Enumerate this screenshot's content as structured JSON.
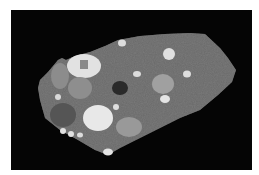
{
  "image": {
    "description": "Polished cross-section of a grey granular stone slab with rounded inclusions on a black background",
    "colors": {
      "background": "#ffffff",
      "frame": "#050505",
      "matrix": "#7a7a7a",
      "inclusion_light": "#e6e6e6",
      "inclusion_mid": "#9a9a9a",
      "inclusion_dark": "#555555",
      "inclusion_darkest": "#2a2a2a"
    }
  }
}
